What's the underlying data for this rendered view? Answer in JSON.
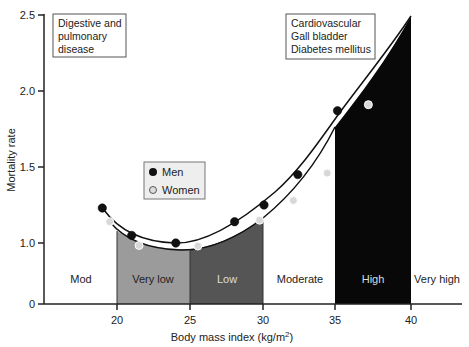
{
  "chart_data": {
    "type": "scatter",
    "title": "",
    "xlabel": "Body mass index (kg/m²)",
    "ylabel": "Mortality rate",
    "xlim": [
      13.5,
      43.5
    ],
    "ylim": [
      0,
      2.5
    ],
    "y_axis_break": "0 to 1.0 compressed",
    "xticks": [
      "20",
      "25",
      "30",
      "35",
      "40"
    ],
    "yticks": [
      "0",
      "1.0",
      "1.5",
      "2.0",
      "2.5"
    ],
    "legend": {
      "position": "center-left",
      "entries": [
        "Men",
        "Women"
      ]
    },
    "series": [
      {
        "name": "Men",
        "marker": "filled-black",
        "x": [
          19.0,
          21.0,
          24.0,
          28.0,
          30.0,
          32.3,
          35.0
        ],
        "y": [
          1.23,
          1.05,
          1.0,
          1.14,
          1.25,
          1.45,
          1.87
        ]
      },
      {
        "name": "Women",
        "marker": "light-grey",
        "x": [
          19.5,
          21.5,
          25.5,
          29.7,
          32.0,
          34.3,
          37.1
        ],
        "y": [
          1.14,
          0.96,
          0.95,
          1.15,
          1.28,
          1.46,
          1.91
        ]
      }
    ],
    "zones": [
      {
        "label": "Mod",
        "from": 13.5,
        "to": 20,
        "fill": "#ffffff"
      },
      {
        "label": "Very low",
        "from": 20,
        "to": 25,
        "fill": "#9a9a9a"
      },
      {
        "label": "Low",
        "from": 25,
        "to": 30,
        "fill": "#555555"
      },
      {
        "label": "Moderate",
        "from": 30,
        "to": 35,
        "fill": "#ffffff"
      },
      {
        "label": "High",
        "from": 35,
        "to": 40,
        "fill": "#0a0a0a"
      },
      {
        "label": "Very high",
        "from": 40,
        "to": 43.5,
        "fill": "#ffffff"
      }
    ],
    "annotations": [
      {
        "text": [
          "Digestive and",
          "pulmonary",
          "disease"
        ],
        "position": "top-left"
      },
      {
        "text": [
          "Cardiovascular",
          "Gall bladder",
          "Diabetes mellitus"
        ],
        "position": "top-right"
      }
    ]
  },
  "labels": {
    "xlabel_main": "Body mass index (kg/m",
    "xlabel_sup": "2",
    "xlabel_close": ")",
    "ylabel": "Mortality rate",
    "box_left": [
      "Digestive and",
      "pulmonary",
      "disease"
    ],
    "box_right": [
      "Cardiovascular",
      "Gall bladder",
      "Diabetes mellitus"
    ],
    "legend_men": "Men",
    "legend_women": "Women",
    "zone_mod": "Mod",
    "zone_very_low": "Very low",
    "zone_low": "Low",
    "zone_moderate": "Moderate",
    "zone_high": "High",
    "zone_very_high": "Very high",
    "xt": [
      "20",
      "25",
      "30",
      "35",
      "40"
    ],
    "yt": [
      "0",
      "1.0",
      "1.5",
      "2.0",
      "2.5"
    ]
  }
}
